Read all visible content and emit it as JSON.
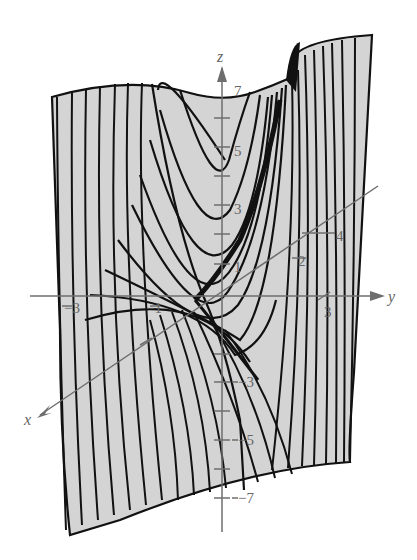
{
  "figure": {
    "type": "3d-surface-plot",
    "colors": {
      "surface_fill": "#d4d4d4",
      "trace_lines": "#111111",
      "axes": "#6e6e6e",
      "labels": "#666666",
      "background": "#ffffff"
    },
    "axes": {
      "x": {
        "label": "x",
        "ticks": [
          "-1",
          "1"
        ]
      },
      "y": {
        "label": "y",
        "ticks": [
          "-3",
          "-1",
          "1",
          "3"
        ]
      },
      "z": {
        "label": "z",
        "ticks": [
          "7",
          "5",
          "3",
          "1",
          "-1",
          "-3",
          "-5",
          "-7"
        ]
      },
      "diagonal_ticks": [
        "2",
        "4"
      ]
    }
  },
  "labels": {
    "z_axis": "z",
    "y_axis": "y",
    "x_axis": "x",
    "z_7": "7",
    "z_5": "5",
    "z_3": "3",
    "z_1": "1",
    "z_m1": "−1",
    "z_m3": "−3",
    "z_m5": "−5",
    "z_m7": "−7",
    "y_m3": "−3",
    "y_m1": "−1",
    "y_3": "3",
    "d_2": "2",
    "d_4": "4"
  }
}
